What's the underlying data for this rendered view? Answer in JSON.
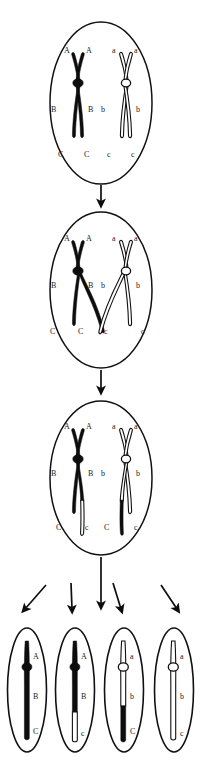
{
  "diagram": {
    "alleles": {
      "dominant": [
        "A",
        "B",
        "C"
      ],
      "recessive": [
        "a",
        "b",
        "c"
      ]
    },
    "colors": {
      "maternal": "#0d0d0d",
      "paternal": "#ffffff",
      "outline": "#111111",
      "background": "#ffffff"
    }
  },
  "stages": [
    {
      "name": "stage-1-homologous-pair",
      "labels_left": [
        "A",
        "A",
        "B",
        "B",
        "C",
        "C"
      ],
      "labels_right": [
        "a",
        "a",
        "b",
        "b",
        "c",
        "c"
      ],
      "centromere_left": "filled",
      "centromere_right": "open"
    },
    {
      "name": "stage-2-chiasma-crossover",
      "labels_left": [
        "A",
        "A",
        "B",
        "B",
        "C",
        "C"
      ],
      "labels_right": [
        "a",
        "a",
        "b",
        "b",
        "c",
        "c"
      ],
      "centromere_left": "filled",
      "centromere_right": "open"
    },
    {
      "name": "stage-3-recombined",
      "labels_left": [
        "A",
        "A",
        "B",
        "B",
        "C",
        "c"
      ],
      "labels_right": [
        "a",
        "a",
        "b",
        "b",
        "C",
        "c"
      ],
      "centromere_left": "filled",
      "centromere_right": "open"
    }
  ],
  "gametes": [
    {
      "name": "gamete-1",
      "genotype": [
        "A",
        "B",
        "C"
      ],
      "type": "parental",
      "shading": "all-dark",
      "centromere": "filled"
    },
    {
      "name": "gamete-2",
      "genotype": [
        "A",
        "B",
        "c"
      ],
      "type": "recombinant",
      "shading": "dark-top-light-bottom",
      "centromere": "filled"
    },
    {
      "name": "gamete-3",
      "genotype": [
        "a",
        "b",
        "C"
      ],
      "type": "recombinant",
      "shading": "light-top-dark-bottom",
      "centromere": "open"
    },
    {
      "name": "gamete-4",
      "genotype": [
        "a",
        "b",
        "c"
      ],
      "type": "parental",
      "shading": "all-light",
      "centromere": "open"
    }
  ],
  "arrows": {
    "vertical": [
      "arrow-stage1-to-stage2",
      "arrow-stage2-to-stage3",
      "arrow-stage3-to-gametes"
    ],
    "branching": [
      "arrow-to-gamete-1",
      "arrow-to-gamete-2",
      "arrow-to-gamete-3",
      "arrow-to-gamete-4"
    ]
  }
}
